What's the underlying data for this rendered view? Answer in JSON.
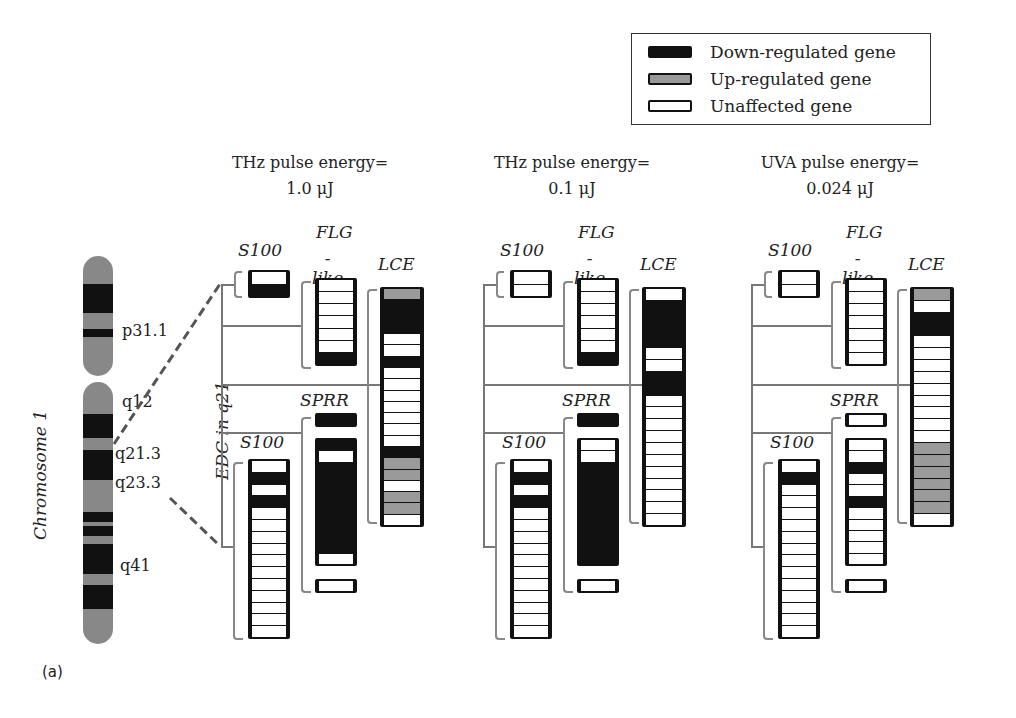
{
  "legend": {
    "items": [
      {
        "label": "Down-regulated gene",
        "state": "down",
        "color": "#111111"
      },
      {
        "label": "Up-regulated gene",
        "state": "up",
        "color": "#999999"
      },
      {
        "label": "Unaffected gene",
        "state": "none",
        "color": "#ffffff"
      }
    ]
  },
  "chromosome": {
    "label": "Chromosome 1",
    "edc_label": "EDC in q21",
    "bands": [
      "p31.1",
      "q12",
      "q21.3",
      "q23.3",
      "q41"
    ]
  },
  "panel_label": "(a)",
  "panels": [
    {
      "title_line1": "THz pulse energy=",
      "title_line2": "1.0 μJ",
      "groups": {
        "s100_top": {
          "label": "S100",
          "cells": [
            "n",
            "d"
          ]
        },
        "flg_like": {
          "label_line1": "FLG",
          "label_line2": "-like",
          "cells": [
            "n",
            "n",
            "n",
            "n",
            "n",
            "n",
            "d"
          ]
        },
        "lce": {
          "label": "LCE",
          "cells": [
            "u",
            "d",
            "d",
            "d",
            "n",
            "n",
            "d",
            "n",
            "n",
            "n",
            "n",
            "n",
            "n",
            "n",
            "d",
            "u",
            "u",
            "n",
            "u",
            "u",
            "n"
          ]
        },
        "sprr": {
          "label": "SPRR",
          "cells_top": [
            "d"
          ],
          "cells_main": [
            "d",
            "n",
            "d",
            "d",
            "d",
            "d",
            "d",
            "d",
            "d",
            "d",
            "n"
          ],
          "cells_bottom": [
            "n"
          ]
        },
        "s100_bottom": {
          "label": "S100",
          "cells": [
            "n",
            "d",
            "n",
            "d",
            "n",
            "n",
            "n",
            "n",
            "n",
            "n",
            "n",
            "n",
            "n",
            "n",
            "n"
          ]
        }
      }
    },
    {
      "title_line1": "THz pulse energy=",
      "title_line2": "0.1 μJ",
      "groups": {
        "s100_top": {
          "label": "S100",
          "cells": [
            "n",
            "n"
          ]
        },
        "flg_like": {
          "label_line1": "FLG",
          "label_line2": "-like",
          "cells": [
            "n",
            "n",
            "n",
            "n",
            "n",
            "n",
            "d"
          ]
        },
        "lce": {
          "label": "LCE",
          "cells": [
            "n",
            "d",
            "d",
            "d",
            "d",
            "n",
            "n",
            "d",
            "d",
            "n",
            "n",
            "n",
            "n",
            "n",
            "n",
            "n",
            "n",
            "n",
            "n",
            "n"
          ]
        },
        "sprr": {
          "label": "SPRR",
          "cells_top": [
            "d"
          ],
          "cells_main": [
            "n",
            "n",
            "d",
            "d",
            "d",
            "d",
            "d",
            "d",
            "d",
            "d",
            "d"
          ],
          "cells_bottom": [
            "n"
          ]
        },
        "s100_bottom": {
          "label": "S100",
          "cells": [
            "n",
            "d",
            "n",
            "d",
            "n",
            "n",
            "n",
            "n",
            "n",
            "n",
            "n",
            "n",
            "n",
            "n",
            "n"
          ]
        }
      }
    },
    {
      "title_line1": "UVA pulse energy=",
      "title_line2": "0.024 μJ",
      "groups": {
        "s100_top": {
          "label": "S100",
          "cells": [
            "n",
            "n"
          ]
        },
        "flg_like": {
          "label_line1": "FLG",
          "label_line2": "-like",
          "cells": [
            "n",
            "n",
            "n",
            "n",
            "n",
            "n",
            "n"
          ]
        },
        "lce": {
          "label": "LCE",
          "cells": [
            "u",
            "n",
            "d",
            "d",
            "n",
            "n",
            "n",
            "n",
            "n",
            "n",
            "n",
            "n",
            "n",
            "u",
            "u",
            "u",
            "u",
            "u",
            "u",
            "n"
          ]
        },
        "sprr": {
          "label": "SPRR",
          "cells_top": [
            "n"
          ],
          "cells_main": [
            "n",
            "n",
            "d",
            "n",
            "n",
            "d",
            "n",
            "n",
            "n",
            "n",
            "n"
          ],
          "cells_bottom": [
            "n"
          ]
        },
        "s100_bottom": {
          "label": "S100",
          "cells": [
            "n",
            "d",
            "n",
            "n",
            "n",
            "n",
            "n",
            "n",
            "n",
            "n",
            "n",
            "n",
            "n",
            "n",
            "n"
          ]
        }
      }
    }
  ]
}
